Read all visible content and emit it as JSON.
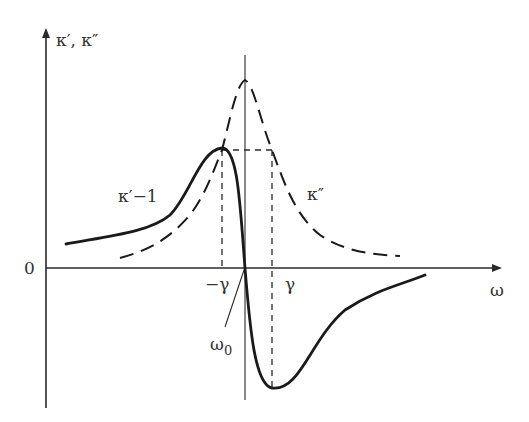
{
  "diagram": {
    "y_axis_label": "κ′, κ″",
    "x_axis_label": "ω",
    "origin_label": "0",
    "minus_gamma_label": "−γ",
    "gamma_label": "γ",
    "omega0_label": "ω",
    "omega0_subscript": "0",
    "real_curve_label": "κ′−1",
    "imag_curve_label": "κ″",
    "colors": {
      "ink": "#1a1a1a",
      "background": "#ffffff"
    }
  }
}
